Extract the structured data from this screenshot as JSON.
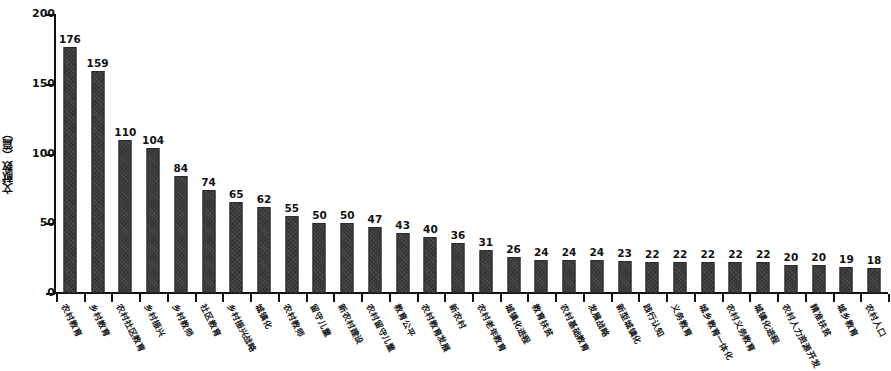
{
  "chart_data": {
    "type": "bar",
    "title": "",
    "subtitle": "",
    "xlabel": "",
    "ylabel": "文献数（篇）",
    "ylim": [
      0,
      200
    ],
    "yticks": [
      0,
      50,
      100,
      150,
      200
    ],
    "grid": false,
    "legend": null,
    "bar_color": "#3a3a3a",
    "categories": [
      "农村教育",
      "乡村教育",
      "农村社区教育",
      "乡村振兴",
      "乡村教师",
      "社区教育",
      "乡村振兴战略",
      "城镇化",
      "农村教师",
      "留守儿童",
      "新农村建设",
      "农村留守儿童",
      "教育公平",
      "农村教育发展",
      "新农村",
      "农村老年教育",
      "城镇化进程",
      "教育扶贫",
      "农村基础教育",
      "发展战略",
      "新型城镇化",
      "践行认知",
      "义务教育",
      "城乡教育一体化",
      "农村义务教育",
      "城镇化进程",
      "农村人力资源开发",
      "精准扶贫",
      "城乡教育",
      "农村人口"
    ],
    "values": [
      176,
      159,
      110,
      104,
      84,
      74,
      65,
      62,
      55,
      50,
      50,
      47,
      43,
      40,
      36,
      31,
      26,
      24,
      24,
      24,
      23,
      22,
      22,
      22,
      22,
      22,
      20,
      20,
      19,
      18
    ]
  }
}
